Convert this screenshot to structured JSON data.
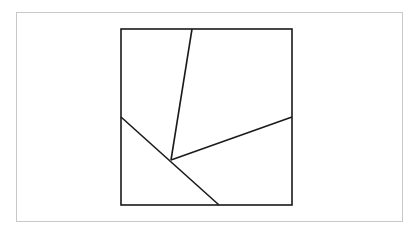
{
  "diagram": {
    "type": "geometric-dissection",
    "stroke_color": "#1a1a1a",
    "frame_color": "#c8c8c8",
    "square": {
      "x1": 121,
      "y1": 29,
      "x2": 292,
      "y2": 205
    },
    "interior_point": {
      "x": 171,
      "y": 160
    },
    "segments": [
      {
        "name": "top-to-center",
        "x1": 192,
        "y1": 29,
        "x2": 171,
        "y2": 160
      },
      {
        "name": "right-to-center",
        "x1": 292,
        "y1": 117,
        "x2": 171,
        "y2": 160
      },
      {
        "name": "left-to-bottom",
        "x1": 121,
        "y1": 117,
        "x2": 219,
        "y2": 205
      }
    ]
  }
}
